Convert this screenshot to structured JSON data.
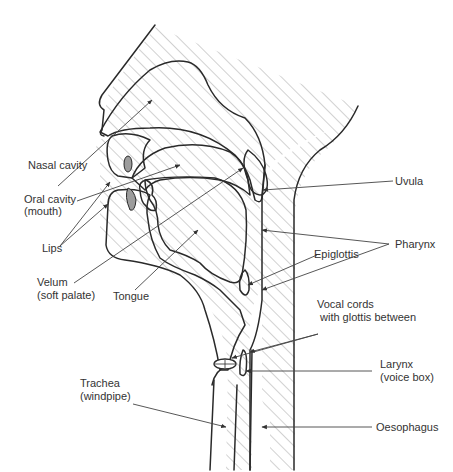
{
  "diagram": {
    "colors": {
      "outline": "#2a2a2a",
      "hatch": "#9a9a9a",
      "tongue_hatch": "#777777",
      "lip_fill": "#9c9c9c",
      "label_text": "#333333"
    },
    "labels": {
      "nasal_cavity": "Nasal cavity",
      "oral_cavity_1": "Oral cavity",
      "oral_cavity_2": "(mouth)",
      "lips": "Lips",
      "velum_1": "Velum",
      "velum_2": "(soft palate)",
      "tongue": "Tongue",
      "uvula": "Uvula",
      "pharynx": "Pharynx",
      "epiglottis": "Epiglottis",
      "vocal_cords_1": "Vocal cords",
      "vocal_cords_2": "with glottis between",
      "larynx_1": "Larynx",
      "larynx_2": "(voice box)",
      "trachea_1": "Trachea",
      "trachea_2": "(windpipe)",
      "oesophagus": "Oesophagus"
    }
  }
}
